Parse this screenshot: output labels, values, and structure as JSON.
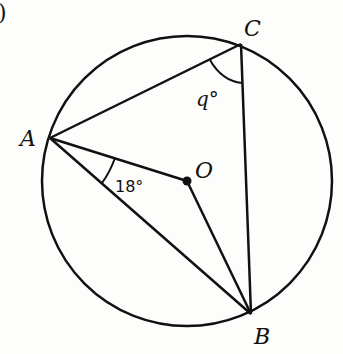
{
  "diagram": {
    "part_marker": ")",
    "points": {
      "A": {
        "label": "A",
        "x": 50,
        "y": 138
      },
      "B": {
        "label": "B",
        "x": 251,
        "y": 314
      },
      "C": {
        "label": "C",
        "x": 241,
        "y": 44
      },
      "O": {
        "label": "O",
        "x": 187,
        "y": 181
      }
    },
    "circle": {
      "cx": 187,
      "cy": 181,
      "r": 145
    },
    "angles": {
      "OAB": "18°",
      "ACB": "q°"
    },
    "colors": {
      "stroke": "#111111",
      "background": "#fdfdfb"
    }
  }
}
